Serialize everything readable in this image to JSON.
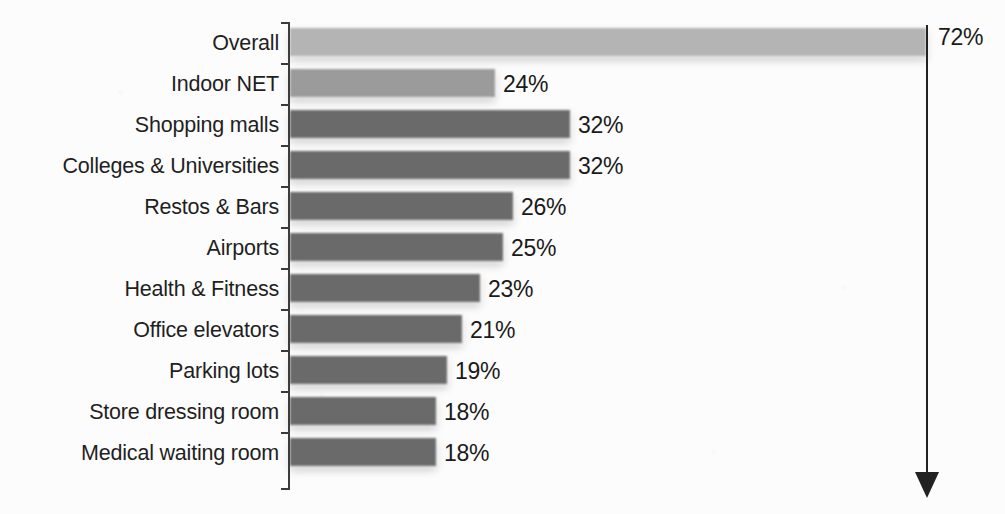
{
  "chart_data": {
    "type": "bar",
    "orientation": "horizontal",
    "title": "",
    "subtitle": "",
    "xlabel": "",
    "ylabel": "",
    "grid": false,
    "legend": null,
    "axis_range_note": "bars drawn non-proportionally as printed",
    "categories": [
      "Overall",
      "Indoor NET",
      "Shopping malls",
      "Colleges & Universities",
      "Restos & Bars",
      "Airports",
      "Health & Fitness",
      "Office elevators",
      "Parking lots",
      "Store dressing room",
      "Medical waiting room"
    ],
    "values": [
      72,
      24,
      32,
      32,
      26,
      25,
      23,
      21,
      19,
      18,
      18
    ],
    "value_labels": [
      "72%",
      "24%",
      "32%",
      "32%",
      "26%",
      "25%",
      "23%",
      "21%",
      "19%",
      "18%",
      "18%"
    ]
  },
  "series_colors": {
    "overall_bar": "#b4b4b4",
    "net_bar": "#9b9b9b",
    "venue_bar": "#6a6a6a",
    "axis": "#3c3c3c",
    "leader": "#222222",
    "text": "#1a1a1a",
    "background": "#fcfcfc"
  },
  "rows": [
    {
      "label": "Overall",
      "value_label": "72%",
      "bar_px": 636,
      "tone": "light",
      "label_x_px": 938,
      "top": 22
    },
    {
      "label": "Indoor NET",
      "value_label": "24%",
      "bar_px": 205,
      "tone": "mid",
      "label_x_px": 503,
      "top": 63
    },
    {
      "label": "Shopping malls",
      "value_label": "32%",
      "bar_px": 280,
      "tone": "dark",
      "label_x_px": 578,
      "top": 104
    },
    {
      "label": "Colleges & Universities",
      "value_label": "32%",
      "bar_px": 280,
      "tone": "dark",
      "label_x_px": 578,
      "top": 145
    },
    {
      "label": "Restos & Bars",
      "value_label": "26%",
      "bar_px": 223,
      "tone": "dark",
      "label_x_px": 521,
      "top": 186
    },
    {
      "label": "Airports",
      "value_label": "25%",
      "bar_px": 213,
      "tone": "dark",
      "label_x_px": 511,
      "top": 227
    },
    {
      "label": "Health & Fitness",
      "value_label": "23%",
      "bar_px": 190,
      "tone": "dark",
      "label_x_px": 488,
      "top": 268
    },
    {
      "label": "Office elevators",
      "value_label": "21%",
      "bar_px": 172,
      "tone": "dark",
      "label_x_px": 470,
      "top": 309
    },
    {
      "label": "Parking lots",
      "value_label": "19%",
      "bar_px": 157,
      "tone": "dark",
      "label_x_px": 455,
      "top": 350
    },
    {
      "label": "Store dressing room",
      "value_label": "18%",
      "bar_px": 146,
      "tone": "dark",
      "label_x_px": 444,
      "top": 391
    },
    {
      "label": "Medical waiting room",
      "value_label": "18%",
      "bar_px": 146,
      "tone": "dark",
      "label_x_px": 444,
      "top": 432
    }
  ],
  "annotations": {
    "overall_leader_value": "72%"
  }
}
